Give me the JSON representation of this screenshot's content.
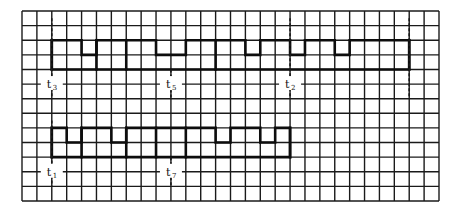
{
  "diagram": {
    "type": "timing-waveform-on-grid",
    "grid": {
      "columns": 28,
      "rows": 13
    },
    "colors": {
      "background": "#ffffff",
      "ink": "#111111"
    },
    "waveforms": [
      {
        "name": "upper",
        "high_row": 2,
        "mid_row": 3,
        "low_row": 4,
        "start_col": 2,
        "end_col": 26,
        "mid_segments": [
          [
            4,
            5
          ],
          [
            9,
            11
          ],
          [
            15,
            16
          ],
          [
            18,
            19
          ],
          [
            21,
            22
          ]
        ],
        "full_dividers": [
          2,
          5,
          7,
          13,
          26
        ]
      },
      {
        "name": "lower",
        "high_row": 8,
        "mid_row": 9,
        "low_row": 10,
        "start_col": 2,
        "end_col": 18,
        "mid_segments": [
          [
            3,
            4
          ],
          [
            6,
            7
          ],
          [
            13,
            14
          ],
          [
            16,
            17
          ]
        ],
        "full_dividers": [
          2,
          4,
          7,
          9,
          11,
          18
        ]
      }
    ],
    "markers": [
      {
        "label": "t",
        "sub": "3",
        "col": 2,
        "label_row": 5,
        "from_row": 0.5,
        "to_row": 6
      },
      {
        "label": "t",
        "sub": "5",
        "col": 10,
        "label_row": 5,
        "from_row": 4,
        "to_row": 6
      },
      {
        "label": "t",
        "sub": "2",
        "col": 18,
        "label_row": 5,
        "from_row": 0.5,
        "to_row": 6
      },
      {
        "label": "",
        "sub": "",
        "col": 26,
        "label_row": 5,
        "from_row": 0.5,
        "to_row": 6
      },
      {
        "label": "t",
        "sub": "1",
        "col": 2,
        "label_row": 11,
        "from_row": 7.5,
        "to_row": 12
      },
      {
        "label": "t",
        "sub": "7",
        "col": 10,
        "label_row": 11,
        "from_row": 10,
        "to_row": 12
      }
    ]
  }
}
